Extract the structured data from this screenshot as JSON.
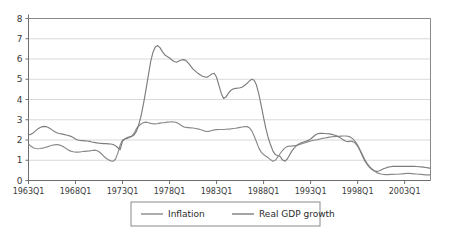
{
  "chart_data": {
    "type": "line",
    "title": "",
    "xlabel": "",
    "ylabel": "",
    "ylim": [
      0,
      8
    ],
    "ytick_values": [
      0,
      1,
      2,
      3,
      4,
      5,
      6,
      7,
      8
    ],
    "ytick_labels": [
      "0",
      "1",
      "2",
      "3",
      "4",
      "5",
      "6",
      "7",
      "8"
    ],
    "grid": true,
    "legend_position": "bottom-center",
    "x_start_label": "1963Q1",
    "x_tick_labels": [
      "1963Q1",
      "1968Q1",
      "1973Q1",
      "1978Q1",
      "1983Q1",
      "1988Q1",
      "1993Q1",
      "1998Q1",
      "2003Q1"
    ],
    "x_tick_index": [
      0,
      20,
      40,
      60,
      80,
      100,
      120,
      140,
      160
    ],
    "x_quarters_total": 172,
    "series": [
      {
        "name": "Inflation",
        "color": "#8a8a8a",
        "values": [
          1.8,
          1.7,
          1.62,
          1.58,
          1.57,
          1.58,
          1.6,
          1.63,
          1.66,
          1.7,
          1.74,
          1.76,
          1.78,
          1.76,
          1.72,
          1.66,
          1.58,
          1.5,
          1.45,
          1.42,
          1.4,
          1.4,
          1.41,
          1.43,
          1.44,
          1.45,
          1.46,
          1.48,
          1.5,
          1.48,
          1.42,
          1.32,
          1.2,
          1.1,
          1.02,
          0.97,
          0.95,
          1.05,
          1.35,
          1.75,
          2.0,
          2.05,
          2.08,
          2.12,
          2.2,
          2.35,
          2.58,
          2.7,
          2.8,
          2.86,
          2.88,
          2.85,
          2.82,
          2.8,
          2.8,
          2.81,
          2.83,
          2.85,
          2.86,
          2.88,
          2.89,
          2.9,
          2.89,
          2.86,
          2.8,
          2.72,
          2.65,
          2.62,
          2.61,
          2.6,
          2.59,
          2.57,
          2.55,
          2.52,
          2.48,
          2.44,
          2.42,
          2.44,
          2.47,
          2.5,
          2.51,
          2.52,
          2.52,
          2.52,
          2.53,
          2.54,
          2.55,
          2.57,
          2.58,
          2.6,
          2.62,
          2.64,
          2.66,
          2.66,
          2.6,
          2.45,
          2.2,
          1.9,
          1.6,
          1.4,
          1.28,
          1.2,
          1.12,
          1.02,
          0.95,
          1.0,
          1.15,
          1.32,
          1.48,
          1.6,
          1.68,
          1.7,
          1.7,
          1.72,
          1.74,
          1.77,
          1.8,
          1.84,
          1.88,
          1.92,
          1.95,
          1.98,
          2.0,
          2.02,
          2.05,
          2.08,
          2.1,
          2.12,
          2.14,
          2.16,
          2.17,
          2.18,
          2.18,
          2.19,
          2.2,
          2.2,
          2.18,
          2.14,
          2.05,
          1.92,
          1.75,
          1.52,
          1.28,
          1.05,
          0.85,
          0.7,
          0.58,
          0.48,
          0.4,
          0.35,
          0.32,
          0.3,
          0.29,
          0.29,
          0.3,
          0.3,
          0.31,
          0.31,
          0.32,
          0.33,
          0.34,
          0.35,
          0.35,
          0.34,
          0.33,
          0.32,
          0.31,
          0.3,
          0.29,
          0.28,
          0.28,
          0.28
        ]
      },
      {
        "name": "Real GDP growth",
        "color": "#7d7d7d",
        "values": [
          2.25,
          2.28,
          2.35,
          2.45,
          2.55,
          2.62,
          2.66,
          2.67,
          2.64,
          2.58,
          2.5,
          2.42,
          2.36,
          2.32,
          2.3,
          2.28,
          2.25,
          2.22,
          2.18,
          2.12,
          2.05,
          2.0,
          1.98,
          1.97,
          1.96,
          1.95,
          1.93,
          1.9,
          1.88,
          1.86,
          1.84,
          1.83,
          1.82,
          1.82,
          1.81,
          1.8,
          1.78,
          1.72,
          1.62,
          1.52,
          1.95,
          2.05,
          2.12,
          2.16,
          2.18,
          2.26,
          2.45,
          2.8,
          3.25,
          3.85,
          4.5,
          5.2,
          5.9,
          6.35,
          6.6,
          6.66,
          6.55,
          6.35,
          6.2,
          6.12,
          6.05,
          5.95,
          5.88,
          5.84,
          5.9,
          5.95,
          5.97,
          5.92,
          5.8,
          5.65,
          5.5,
          5.4,
          5.3,
          5.22,
          5.15,
          5.12,
          5.1,
          5.18,
          5.26,
          5.3,
          5.1,
          4.7,
          4.3,
          4.05,
          4.12,
          4.3,
          4.45,
          4.52,
          4.55,
          4.56,
          4.58,
          4.62,
          4.7,
          4.8,
          4.92,
          5.0,
          4.95,
          4.7,
          4.25,
          3.7,
          3.1,
          2.55,
          2.1,
          1.75,
          1.45,
          1.28,
          1.22,
          1.2,
          1.02,
          0.95,
          1.05,
          1.25,
          1.45,
          1.6,
          1.72,
          1.8,
          1.86,
          1.9,
          1.94,
          1.98,
          2.05,
          2.15,
          2.25,
          2.31,
          2.33,
          2.33,
          2.32,
          2.31,
          2.3,
          2.28,
          2.25,
          2.21,
          2.15,
          2.08,
          2.0,
          1.94,
          1.92,
          1.95,
          1.92,
          1.85,
          1.7,
          1.48,
          1.22,
          0.98,
          0.8,
          0.66,
          0.55,
          0.48,
          0.45,
          0.47,
          0.52,
          0.58,
          0.62,
          0.66,
          0.68,
          0.7,
          0.7,
          0.7,
          0.7,
          0.7,
          0.7,
          0.7,
          0.7,
          0.7,
          0.7,
          0.69,
          0.68,
          0.67,
          0.66,
          0.64,
          0.62,
          0.6
        ]
      }
    ],
    "legend_entries": [
      {
        "label": "Inflation",
        "color": "#8a8a8a"
      },
      {
        "label": "Real GDP growth",
        "color": "#7d7d7d"
      }
    ]
  },
  "legend": {
    "entry_0_label": "Inflation",
    "entry_1_label": "Real GDP growth"
  },
  "colors": {
    "grid": "#c9c9c9",
    "axis": "#6e6e6e",
    "border": "#8a8a8a",
    "text": "#3a3a3a",
    "background": "#ffffff"
  }
}
